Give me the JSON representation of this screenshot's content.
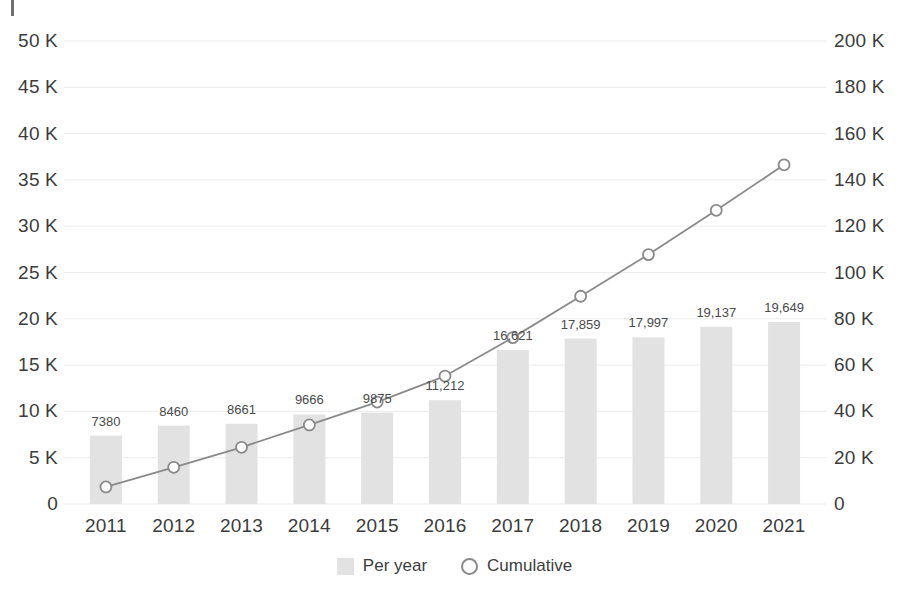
{
  "chart_data": {
    "type": "bar",
    "title": "",
    "subtitle": "",
    "xlabel": "",
    "ylabel": "",
    "grid": true,
    "legend_position": "bottom",
    "categories": [
      "2011",
      "2012",
      "2013",
      "2014",
      "2015",
      "2016",
      "2017",
      "2018",
      "2019",
      "2020",
      "2021"
    ],
    "series": [
      {
        "name": "Per year",
        "type": "bar",
        "axis": "left",
        "color": "#e2e2e2",
        "values": [
          7380,
          8460,
          8661,
          9666,
          9875,
          11212,
          16621,
          17859,
          17997,
          19137,
          19649
        ],
        "labels": [
          "7380",
          "8460",
          "8661",
          "9666",
          "9875",
          "11,212",
          "16,621",
          "17,859",
          "17,997",
          "19,137",
          "19,649"
        ]
      },
      {
        "name": "Cumulative",
        "type": "line",
        "axis": "right",
        "color": "#8a8a8a",
        "marker": "open-circle",
        "values": [
          7380,
          15840,
          24501,
          34167,
          44042,
          55254,
          71875,
          89734,
          107731,
          126868,
          146517
        ]
      }
    ],
    "left_axis": {
      "label": "",
      "ylim": [
        0,
        50000
      ],
      "tick_values": [
        0,
        5000,
        10000,
        15000,
        20000,
        25000,
        30000,
        35000,
        40000,
        45000,
        50000
      ],
      "tick_labels": [
        "0",
        "5 K",
        "10 K",
        "15 K",
        "20 K",
        "25 K",
        "30 K",
        "35 K",
        "40 K",
        "45 K",
        "50 K"
      ]
    },
    "right_axis": {
      "label": "",
      "ylim": [
        0,
        200000
      ],
      "tick_values": [
        0,
        20000,
        40000,
        60000,
        80000,
        100000,
        120000,
        140000,
        160000,
        180000,
        200000
      ],
      "tick_labels": [
        "0",
        "20 K",
        "40 K",
        "60 K",
        "80 K",
        "100 K",
        "120 K",
        "140 K",
        "160 K",
        "180 K",
        "200 K"
      ]
    },
    "legend": [
      {
        "label": "Per year",
        "marker": "square",
        "color": "#e2e2e2"
      },
      {
        "label": "Cumulative",
        "marker": "open-circle",
        "color": "#8a8a8a"
      }
    ]
  },
  "colors": {
    "bar": "#e2e2e2",
    "line": "#8a8a8a",
    "grid": "#ececec",
    "text": "#3c3c3c",
    "background": "#ffffff"
  }
}
